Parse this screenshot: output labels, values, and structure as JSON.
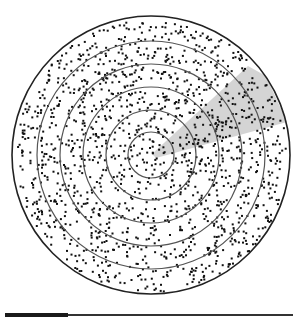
{
  "diagram": {
    "type": "concentric-rings-stippled-disc",
    "center": [
      151,
      155
    ],
    "outer_radius": 139,
    "ring_radii": [
      23,
      45,
      68,
      91,
      114
    ],
    "dot_color": "#111111",
    "ring_color": "#555555",
    "outline_color": "#222222",
    "beam": {
      "color": "#cccccc",
      "opacity": 0.85,
      "polygon": [
        [
          152,
          154
        ],
        [
          248,
          66
        ],
        [
          266,
          76
        ],
        [
          287,
          122
        ],
        [
          156,
          158
        ]
      ]
    },
    "dot_count": 1500,
    "seed": 7
  },
  "scale_bar": {
    "thick_color": "#1a1a1a",
    "thin_color": "#333333"
  }
}
